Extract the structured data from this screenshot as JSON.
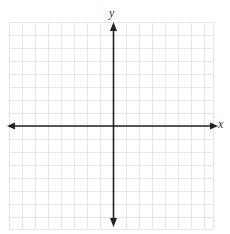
{
  "diagram": {
    "type": "coordinate-plane",
    "axes": {
      "x_label": "x",
      "y_label": "y"
    },
    "grid": {
      "columns": 16,
      "rows": 16,
      "line_color": "#e4e4e4",
      "axis_color": "#222222"
    }
  }
}
